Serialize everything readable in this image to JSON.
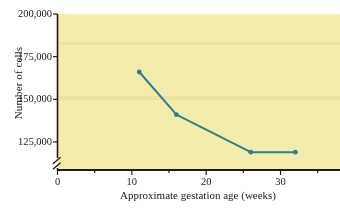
{
  "chart_data": {
    "type": "line",
    "title": "",
    "xlabel": "Approximate gestation age (weeks)",
    "ylabel": "Number of cells",
    "x": [
      11,
      16,
      26,
      32
    ],
    "values": [
      166000,
      141000,
      119000,
      119000
    ],
    "series": [
      {
        "name": "Number of cells",
        "x": [
          11,
          16,
          26,
          32
        ],
        "values": [
          166000,
          141000,
          119000,
          119000
        ]
      }
    ],
    "xlim": [
      0,
      38
    ],
    "ylim": [
      115000,
      200000
    ],
    "xticks": [
      0,
      10,
      20,
      30
    ],
    "xtick_labels": [
      "0",
      "10",
      "20",
      "30"
    ],
    "xminor_ticks": [
      5,
      15,
      25,
      35
    ],
    "yticks": [
      125000,
      150000,
      175000,
      200000
    ],
    "ytick_labels": [
      "125,000",
      "150,000",
      "175,000",
      "200,000"
    ],
    "y_axis_break": true,
    "grid": false,
    "legend": null,
    "marker": "circle",
    "colors": {
      "line": "#2f7e94",
      "marker": "#2f7e94",
      "plot_background": "#f4ecab",
      "axis": "#241a10",
      "text": "#1a1a1a",
      "figure_background": "#ffffff"
    }
  }
}
